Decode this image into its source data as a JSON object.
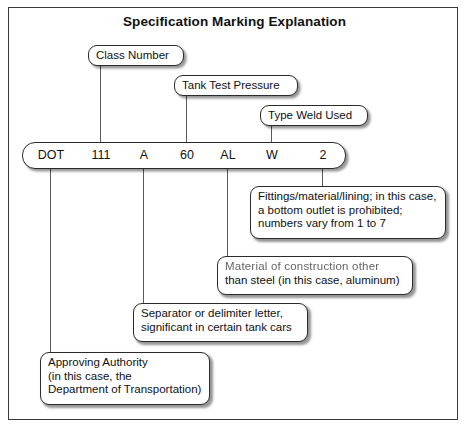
{
  "diagram": {
    "title": "Specification Marking Explanation",
    "marking_code": {
      "segments": [
        {
          "label": "DOT",
          "x": 50
        },
        {
          "label": "111",
          "x": 100
        },
        {
          "label": "A",
          "x": 143
        },
        {
          "label": "60",
          "x": 186
        },
        {
          "label": "AL",
          "x": 227
        },
        {
          "label": "W",
          "x": 271
        },
        {
          "label": "2",
          "x": 322
        }
      ]
    },
    "callouts_above": [
      {
        "name": "class-number",
        "lines": [
          "Class Number"
        ]
      },
      {
        "name": "tank-test-pressure",
        "lines": [
          "Tank Test Pressure"
        ]
      },
      {
        "name": "type-weld-used",
        "lines": [
          "Type Weld Used"
        ]
      }
    ],
    "callouts_below": [
      {
        "name": "fittings-material-lining",
        "lines": [
          "Fittings/material/lining; in this case,",
          "a bottom outlet is prohibited;",
          "numbers vary from 1 to 7"
        ]
      },
      {
        "name": "material-of-construction",
        "lines": [
          "Material of construction other",
          "than steel (in this case, aluminum)"
        ]
      },
      {
        "name": "separator-letter",
        "lines": [
          "Separator or delimiter letter,",
          "significant in certain tank cars"
        ]
      },
      {
        "name": "approving-authority",
        "lines": [
          "Approving Authority",
          "(in this case, the",
          "Department of Transportation)"
        ]
      }
    ],
    "colors": {
      "frame_border": "#3a3a3a",
      "box_border": "#2b2b2b",
      "connector": "#5a5a5a",
      "text": "#111111",
      "background": "#ffffff"
    }
  }
}
